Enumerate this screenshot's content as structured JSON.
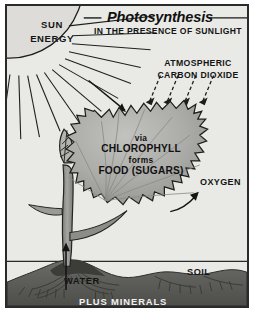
{
  "poster": {
    "title": "Photosynthesis",
    "subtitle": "IN THE PRESENCE OF SUNLIGHT",
    "labels": {
      "sun_energy_line1": "SUN",
      "sun_energy_line2": "ENERGY",
      "co2_line1": "ATMOSPHERIC",
      "co2_line2": "CARBON DIOXIDE",
      "leaf_line1": "via",
      "leaf_line2": "CHLOROPHYLL",
      "leaf_line3": "forms",
      "leaf_line4": "FOOD (SUGARS)",
      "oxygen": "OXYGEN",
      "water": "WATER",
      "soil": "SOIL",
      "plus_minerals": "PLUS MINERALS"
    },
    "colors": {
      "paper": "#e9e9e6",
      "border": "#2a2a2a",
      "ink": "#141414",
      "leaf_fill": "#a9a9a6",
      "soil_fill": "#5b5b58",
      "stem_fill": "#8e8e8b",
      "sun_fill": "#dcdcd8",
      "minerals_text": "#f2f2f0"
    },
    "icons": {
      "sun": "sun-quarter-icon",
      "sun_ray_arrow": "sunlight-arrow-icon",
      "co2_arrows": "carbon-dioxide-arrows-icon",
      "oxygen_arrow": "oxygen-arrow-icon",
      "water_arrow": "water-uptake-arrow-icon",
      "leaf": "leaf-icon",
      "plant": "plant-stem-icon",
      "roots": "roots-icon",
      "ground_line": "ground-level-line"
    }
  }
}
